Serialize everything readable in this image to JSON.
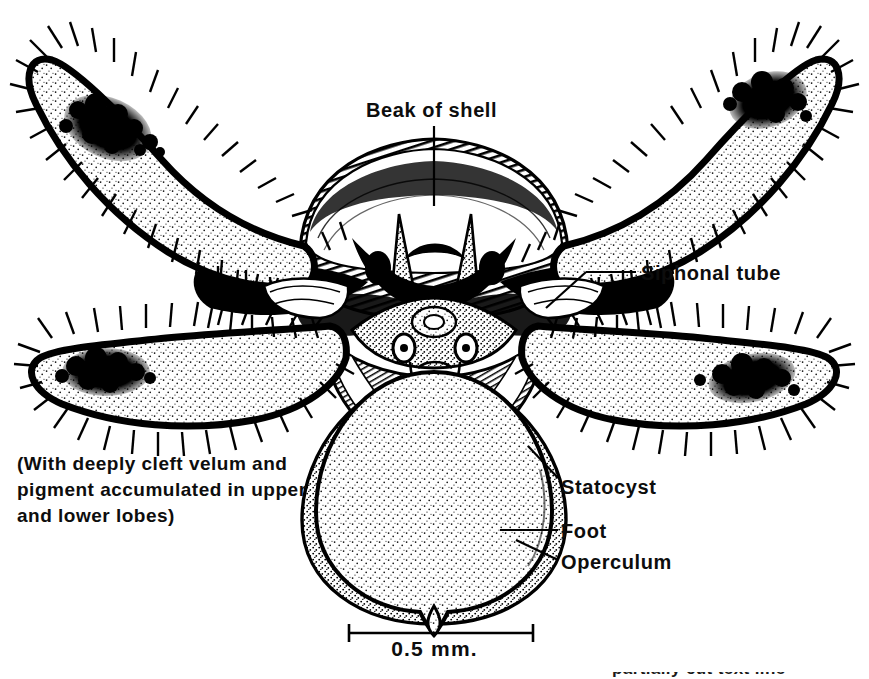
{
  "figure": {
    "background_color": "#ffffff",
    "ink_color": "#000000",
    "width": 869,
    "height": 679
  },
  "labels": {
    "beak_of_shell": "Beak of shell",
    "siphonal_tube": "Siphonal tube",
    "statocyst": "Statocyst",
    "foot": "Foot",
    "operculum": "Operculum"
  },
  "caption": {
    "line1": "(With deeply cleft velum and",
    "line2": "pigment accumulated in upper",
    "line3": "and lower lobes)"
  },
  "scale_bar": {
    "value": "0.5",
    "unit": "mm.",
    "text": "0.5  mm.",
    "x_start": 348,
    "x_end": 534,
    "y": 633
  },
  "clipped_footer": {
    "text": "partially cut text line"
  },
  "anatomy": {
    "velar_lobes": [
      {
        "name": "upper-left-velar-lobe",
        "pigment": "dark granular patch near tip"
      },
      {
        "name": "upper-right-velar-lobe",
        "pigment": "dark granular patch near tip"
      },
      {
        "name": "lower-left-velar-lobe",
        "pigment": "dark granular patch near tip"
      },
      {
        "name": "lower-right-velar-lobe",
        "pigment": "dark granular patch near tip"
      }
    ],
    "shell": "arched hatched shell with two pointed beak spikes",
    "statocysts": 2,
    "foot_shape": "broad stippled foot with pointed distal tip",
    "operculum": "dark stippled rim behind foot"
  }
}
